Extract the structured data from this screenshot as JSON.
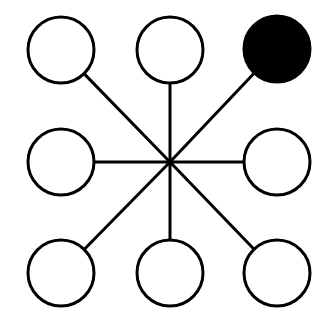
{
  "diagram": {
    "type": "star-network",
    "width": 321,
    "height": 314,
    "stroke_color": "#000000",
    "fill_empty": "#ffffff",
    "fill_highlight": "#000000",
    "stroke_width": 3,
    "node_radius": 33,
    "hub": {
      "x": 170,
      "y": 162
    },
    "nodes": [
      {
        "id": "top-left",
        "x": 61,
        "y": 50,
        "filled": false
      },
      {
        "id": "top-center",
        "x": 170,
        "y": 50,
        "filled": false
      },
      {
        "id": "top-right",
        "x": 277,
        "y": 49,
        "filled": true
      },
      {
        "id": "middle-left",
        "x": 61,
        "y": 162,
        "filled": false
      },
      {
        "id": "middle-right",
        "x": 277,
        "y": 162,
        "filled": false
      },
      {
        "id": "bottom-left",
        "x": 61,
        "y": 273,
        "filled": false
      },
      {
        "id": "bottom-center",
        "x": 170,
        "y": 273,
        "filled": false
      },
      {
        "id": "bottom-right",
        "x": 277,
        "y": 273,
        "filled": false
      }
    ]
  }
}
